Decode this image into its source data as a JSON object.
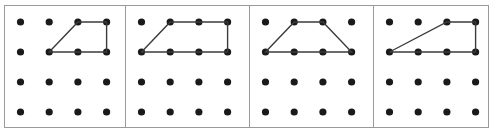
{
  "figure": {
    "background_color": "#ffffff",
    "border_color": "#9a9a9a",
    "dot_color": "#1a1a1a",
    "shape_line_color": "#3b3b3b",
    "dot_radius": 3.6,
    "grid": {
      "columns": 4,
      "rows": 4,
      "column_spacing": 28.7,
      "row_spacing": 30,
      "first_column_x": 20.5,
      "first_row_y": 22
    },
    "panels": [
      {
        "name": "panel-1",
        "label": "a",
        "x": 4,
        "y": 5,
        "width": 121,
        "height": 122,
        "shape": {
          "name": "right-trapezoid-left-slant",
          "closed": true,
          "vertices": [
            {
              "col": 2,
              "row": 2
            },
            {
              "col": 3,
              "row": 1
            },
            {
              "col": 4,
              "row": 1
            },
            {
              "col": 4,
              "row": 2
            }
          ]
        }
      },
      {
        "name": "panel-2",
        "label": "b",
        "x": 125,
        "y": 5,
        "width": 124,
        "height": 122,
        "shape": {
          "name": "right-trapezoid-wide",
          "closed": true,
          "vertices": [
            {
              "col": 1,
              "row": 2
            },
            {
              "col": 2,
              "row": 1
            },
            {
              "col": 4,
              "row": 1
            },
            {
              "col": 4,
              "row": 2
            }
          ]
        }
      },
      {
        "name": "panel-3",
        "label": "c",
        "x": 249,
        "y": 5,
        "width": 124,
        "height": 122,
        "shape": {
          "name": "isosceles-trapezoid",
          "closed": true,
          "vertices": [
            {
              "col": 1,
              "row": 2
            },
            {
              "col": 2,
              "row": 1
            },
            {
              "col": 3,
              "row": 1
            },
            {
              "col": 4,
              "row": 2
            }
          ]
        }
      },
      {
        "name": "panel-4",
        "label": "d",
        "x": 373,
        "y": 5,
        "width": 115,
        "height": 122,
        "shape": {
          "name": "right-trapezoid-long-slant",
          "closed": true,
          "vertices": [
            {
              "col": 1,
              "row": 2
            },
            {
              "col": 3,
              "row": 1
            },
            {
              "col": 4,
              "row": 1
            },
            {
              "col": 4,
              "row": 2
            }
          ]
        }
      }
    ]
  }
}
